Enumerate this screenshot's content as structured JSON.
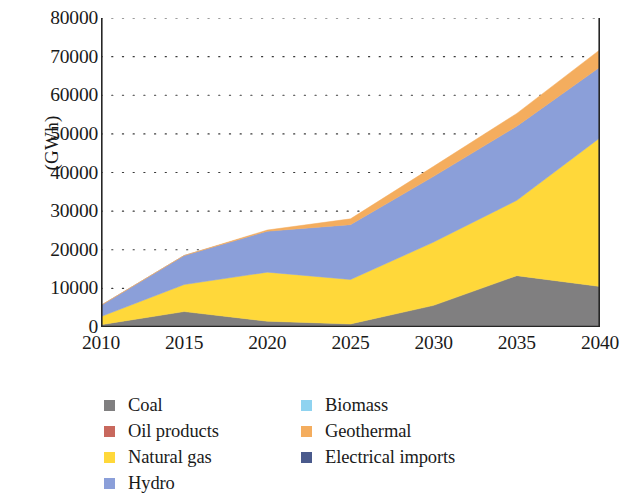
{
  "chart_data": {
    "type": "area",
    "stacked": true,
    "title": "",
    "subtitle": "",
    "xlabel": "",
    "ylabel": "(GWh)",
    "xlim": [
      2010,
      2040
    ],
    "ylim": [
      0,
      80000
    ],
    "x_ticks": [
      2010,
      2015,
      2020,
      2025,
      2030,
      2035,
      2040
    ],
    "y_ticks": [
      0,
      10000,
      20000,
      30000,
      40000,
      50000,
      60000,
      70000,
      80000
    ],
    "grid": "dotted-horizontal",
    "legend_position": "below-plot",
    "x": [
      2010,
      2015,
      2020,
      2025,
      2030,
      2035,
      2040
    ],
    "series": [
      {
        "name": "Coal",
        "color": "#807f80",
        "values": [
          600,
          4000,
          1500,
          800,
          5600,
          13300,
          10500
        ]
      },
      {
        "name": "Oil products",
        "color": "#c8685d",
        "values": [
          0,
          0,
          0,
          0,
          0,
          0,
          0
        ]
      },
      {
        "name": "Natural gas",
        "color": "#ffd83a",
        "values": [
          2100,
          7000,
          12700,
          11500,
          16400,
          19500,
          38500
        ]
      },
      {
        "name": "Hydro",
        "color": "#8b9fd9",
        "values": [
          2900,
          7500,
          10600,
          14200,
          17000,
          19200,
          18300
        ]
      },
      {
        "name": "Biomass",
        "color": "#8fd3f0",
        "values": [
          0,
          0,
          0,
          0,
          0,
          0,
          0
        ]
      },
      {
        "name": "Geothermal",
        "color": "#f4ad5e",
        "values": [
          0,
          0,
          300,
          1500,
          2600,
          3300,
          4500
        ]
      },
      {
        "name": "Electrical imports",
        "color": "#4a5a8c",
        "values": [
          0,
          0,
          0,
          0,
          0,
          0,
          0
        ]
      }
    ],
    "totals": [
      5600,
      18500,
      25100,
      28000,
      41600,
      55300,
      71800
    ]
  },
  "axis": {
    "y_title": "(GWh)",
    "y_tick_labels": [
      "80000",
      "70000",
      "60000",
      "50000",
      "40000",
      "30000",
      "20000",
      "10000",
      "0"
    ],
    "x_tick_labels": [
      "2010",
      "2015",
      "2020",
      "2025",
      "2030",
      "2035",
      "2040"
    ]
  },
  "legend": {
    "left_column": [
      {
        "label": "Coal",
        "color": "#807f80"
      },
      {
        "label": "Oil products",
        "color": "#c8685d"
      },
      {
        "label": "Natural gas",
        "color": "#ffd83a"
      },
      {
        "label": "Hydro",
        "color": "#8b9fd9"
      }
    ],
    "right_column": [
      {
        "label": "Biomass",
        "color": "#8fd3f0"
      },
      {
        "label": "Geothermal",
        "color": "#f4ad5e"
      },
      {
        "label": "Electrical imports",
        "color": "#4a5a8c"
      }
    ]
  }
}
